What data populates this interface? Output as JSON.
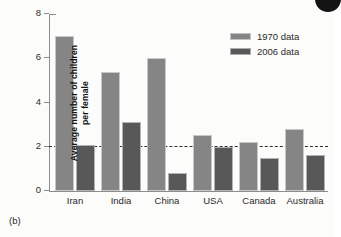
{
  "caption": "(b)",
  "legend": {
    "position": "top-right",
    "entries": [
      {
        "label": "1970 data",
        "color": "#858585"
      },
      {
        "label": "2006 data",
        "color": "#585858"
      }
    ]
  },
  "axes": {
    "y_title_line1": "Average number of children",
    "y_title_line2": "per female",
    "y_ticks": [
      "0",
      "2",
      "4",
      "6",
      "8"
    ]
  },
  "annotations": {
    "reference_line_value": 2
  },
  "chart_data": {
    "type": "bar",
    "title": "",
    "xlabel": "",
    "ylabel": "Average number of children per female",
    "ylim": [
      0,
      8
    ],
    "yticks": [
      0,
      2,
      4,
      6,
      8
    ],
    "grid": false,
    "legend_position": "top-right",
    "categories": [
      "Iran",
      "India",
      "China",
      "USA",
      "Canada",
      "Australia"
    ],
    "series": [
      {
        "name": "1970 data",
        "color": "#858585",
        "values": [
          7.0,
          5.4,
          6.0,
          2.55,
          2.2,
          2.8
        ]
      },
      {
        "name": "2006 data",
        "color": "#585858",
        "values": [
          2.1,
          3.1,
          0.8,
          2.0,
          1.5,
          1.65
        ]
      }
    ],
    "annotations": [
      {
        "type": "hline",
        "value": 2,
        "style": "dashed",
        "color": "#2f2f2f"
      }
    ]
  }
}
